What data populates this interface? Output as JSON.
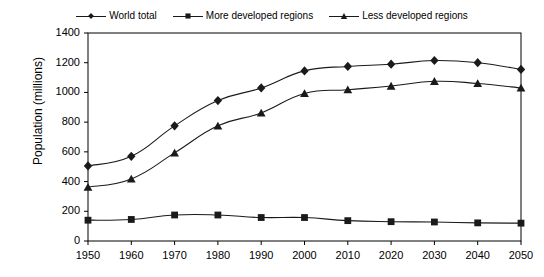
{
  "chart_data": {
    "type": "line",
    "title": "",
    "subtitle": "",
    "xlabel": "",
    "ylabel": "Population (millions)",
    "categories": [
      "1950",
      "1960",
      "1970",
      "1980",
      "1990",
      "2000",
      "2010",
      "2020",
      "2030",
      "2040",
      "2050"
    ],
    "x": [
      1950,
      1960,
      1970,
      1980,
      1990,
      2000,
      2010,
      2020,
      2030,
      2040,
      2050
    ],
    "xlim": [
      1945,
      2055
    ],
    "ylim": [
      0,
      1400
    ],
    "ytick_values": [
      0,
      200,
      400,
      600,
      800,
      1000,
      1200,
      1400
    ],
    "ytick_labels": [
      "0",
      "200",
      "400",
      "600",
      "800",
      "1000",
      "1200",
      "1400"
    ],
    "grid": false,
    "legend_position": "top-center",
    "series": [
      {
        "name": "World total",
        "marker": "diamond",
        "color": "#1a1a1a",
        "values": [
          505,
          570,
          775,
          945,
          1030,
          1145,
          1175,
          1190,
          1215,
          1200,
          1155
        ]
      },
      {
        "name": "More developed regions",
        "marker": "square",
        "color": "#1a1a1a",
        "values": [
          140,
          145,
          175,
          175,
          158,
          158,
          137,
          130,
          128,
          122,
          120
        ]
      },
      {
        "name": "Less developed regions",
        "marker": "triangle",
        "color": "#1a1a1a",
        "values": [
          362,
          418,
          593,
          775,
          862,
          993,
          1018,
          1043,
          1075,
          1060,
          1030
        ]
      }
    ]
  },
  "legend": {
    "entries": [
      {
        "label": "World total",
        "marker": "diamond-marker-icon"
      },
      {
        "label": "More developed regions",
        "marker": "square-marker-icon"
      },
      {
        "label": "Less developed regions",
        "marker": "triangle-marker-icon"
      }
    ]
  },
  "axes": {
    "y_title": "Population (millions)"
  },
  "colors": {
    "line": "#1a1a1a",
    "frame": "#000000",
    "background": "#ffffff",
    "text": "#000000"
  }
}
